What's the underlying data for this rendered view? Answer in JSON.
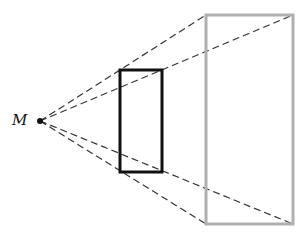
{
  "diagram": {
    "point_label": "M",
    "point": {
      "x": 40,
      "y": 121
    },
    "inner_rect": {
      "x": 120,
      "y": 70,
      "w": 42,
      "h": 102,
      "color": "#111111"
    },
    "outer_rect": {
      "x": 206,
      "y": 15,
      "w": 87,
      "h": 209,
      "color": "#b0b0b0"
    }
  }
}
